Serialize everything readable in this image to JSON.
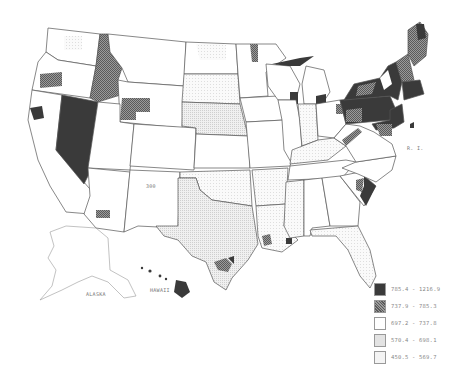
{
  "map": {
    "title_truncated": "",
    "type": "choropleth",
    "region": "United States (by county)",
    "labels": {
      "alaska": "ALASKA",
      "hawaii": "HAWAII",
      "rhode_island": "R. I.",
      "new_mexico_marker": "300"
    }
  },
  "legend": {
    "classes": [
      {
        "range": "785.4 - 1216.9",
        "color": "#3a3a3a",
        "pattern": "solid-dark"
      },
      {
        "range": "737.9 - 785.3",
        "color": "#8a8a8a",
        "pattern": "crosshatch-medium"
      },
      {
        "range": "697.2 - 737.8",
        "color": "#ffffff",
        "pattern": "white"
      },
      {
        "range": "570.4 - 698.1",
        "color": "#e3e3e3",
        "pattern": "light-dots"
      },
      {
        "range": "450.5 - 569.7",
        "color": "#f4f4f4",
        "pattern": "very-light-dots"
      }
    ]
  },
  "colors": {
    "dark": "#3a3a3a",
    "medium": "#8a8a8a",
    "white": "#ffffff",
    "light": "#e3e3e3",
    "verylight": "#f4f4f4",
    "border": "#555555"
  }
}
